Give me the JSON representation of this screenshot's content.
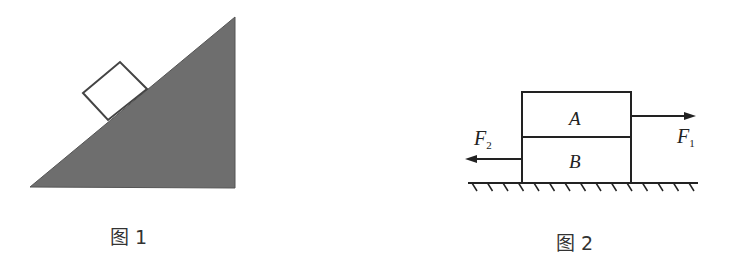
{
  "figure1": {
    "caption": "图 1",
    "description": "block on inclined plane",
    "incline_color": "#6e6e6e"
  },
  "figure2": {
    "caption": "图 2",
    "block_top_label": "A",
    "block_bottom_label": "B",
    "force_right": {
      "symbol": "F",
      "subscript": "1"
    },
    "force_left": {
      "symbol": "F",
      "subscript": "2"
    }
  }
}
